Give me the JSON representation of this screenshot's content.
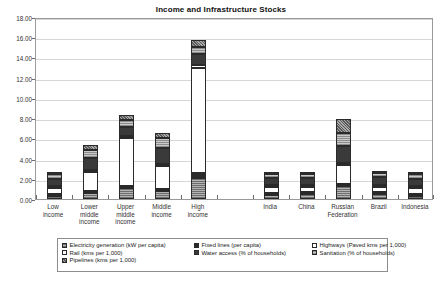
{
  "chart_data": {
    "type": "bar",
    "subtype": "stacked-column",
    "title": "Income and Infrastructure Stocks",
    "xlabel": "",
    "ylabel": "",
    "ylim": [
      0,
      18
    ],
    "ytick_step": 2,
    "ytick_labels": [
      "0.00",
      "2.00",
      "4.00",
      "6.00",
      "8.00",
      "10.00",
      "12.00",
      "14.00",
      "16.00",
      "18.00"
    ],
    "grid": true,
    "legend_position": "bottom",
    "categories": [
      "Low income",
      "Lower middle income",
      "Upper middle income",
      "Middle income",
      "High income",
      "",
      "India",
      "China",
      "Russian Federation",
      "Brazil",
      "Indonesia"
    ],
    "series": [
      {
        "name": "Electricity generation (kW per capita)",
        "key": "elec",
        "fill": "light-gray-hatch",
        "values": [
          0.3,
          0.55,
          1.1,
          0.75,
          2.05,
          null,
          0.35,
          0.45,
          1.25,
          0.45,
          0.3
        ]
      },
      {
        "name": "Fixed lines (per capita)",
        "key": "fixed",
        "fill": "solid-black",
        "values": [
          0.05,
          0.1,
          0.2,
          0.12,
          0.55,
          null,
          0.05,
          0.15,
          0.25,
          0.15,
          0.05
        ]
      },
      {
        "name": "Highways (Paved kms per 1,000)",
        "key": "high",
        "fill": "white",
        "values": [
          0.55,
          1.95,
          4.7,
          2.3,
          10.4,
          null,
          0.6,
          0.55,
          1.85,
          0.55,
          0.6
        ]
      },
      {
        "name": "Rail (kms per 1,000)",
        "key": "rail",
        "fill": "white",
        "values": [
          0.08,
          0.1,
          0.2,
          0.12,
          0.25,
          null,
          0.08,
          0.08,
          0.2,
          0.08,
          0.05
        ]
      },
      {
        "name": "Water access (% of households)",
        "key": "water",
        "fill": "dark-gray",
        "values": [
          0.75,
          1.2,
          0.95,
          1.6,
          1.05,
          null,
          0.75,
          0.7,
          1.65,
          0.75,
          0.7
        ]
      },
      {
        "name": "Sanitation (% of households)",
        "key": "sani",
        "fill": "mid-gray-hatch",
        "values": [
          0.45,
          0.8,
          0.65,
          1.0,
          0.7,
          null,
          0.35,
          0.35,
          1.35,
          0.45,
          0.45
        ]
      },
      {
        "name": "Pipelines (kms per 1,000)",
        "key": "pipe",
        "fill": "diagonal-hatch",
        "values": [
          0.1,
          0.45,
          0.55,
          0.45,
          0.7,
          null,
          0.1,
          0.1,
          1.4,
          0.15,
          0.1
        ]
      }
    ],
    "totals": [
      2.28,
      5.15,
      8.35,
      6.34,
      15.7,
      null,
      2.28,
      2.38,
      7.95,
      2.58,
      2.25
    ]
  },
  "legend": {
    "items": [
      {
        "label": "Electricity generation (kW per capita)",
        "key": "elec"
      },
      {
        "label": "Fixed lines (per capita)",
        "key": "fixed"
      },
      {
        "label": "Highways (Paved kms per 1,000)",
        "key": "high"
      },
      {
        "label": "Rail (kms per 1,000)",
        "key": "rail"
      },
      {
        "label": "Water access (% of households)",
        "key": "water"
      },
      {
        "label": "Sanitation (% of households)",
        "key": "sani"
      },
      {
        "label": "Pipelines (kms per 1,000)",
        "key": "pipe"
      }
    ]
  },
  "colors": {
    "axis": "#9a9a9a",
    "grid": "#d6d6d6",
    "text": "#333333",
    "bar_outline": "#2a2a2a"
  }
}
